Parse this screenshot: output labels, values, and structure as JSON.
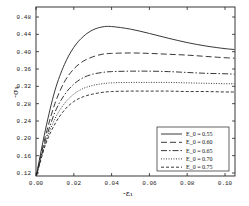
{
  "chart_data": {
    "type": "line",
    "title": "",
    "xlabel": "-ε₁",
    "ylabel": "-σ₁",
    "xlim": [
      0.0,
      0.105
    ],
    "ylim": [
      0.11,
      0.49
    ],
    "x_ticks": [
      "0.00",
      "0.02",
      "0.04",
      "0.06",
      "0.08",
      "0.10"
    ],
    "y_ticks": [
      "0.12",
      "0.16",
      "0.20",
      "0.24",
      "0.28",
      "0.32",
      "0.36",
      "0.40",
      "0.44",
      "0.48"
    ],
    "grid": false,
    "legend_position": "lower right",
    "x": [
      0.0,
      0.005,
      0.01,
      0.015,
      0.02,
      0.025,
      0.03,
      0.035,
      0.04,
      0.05,
      0.06,
      0.07,
      0.08,
      0.09,
      0.1,
      0.105
    ],
    "series": [
      {
        "name": "E_0 = 0.55",
        "style": "solid",
        "values": [
          0.11,
          0.22,
          0.31,
          0.37,
          0.41,
          0.435,
          0.45,
          0.457,
          0.458,
          0.452,
          0.442,
          0.431,
          0.421,
          0.413,
          0.407,
          0.405
        ]
      },
      {
        "name": "E_0 = 0.60",
        "style": "dashed-long",
        "values": [
          0.11,
          0.205,
          0.28,
          0.33,
          0.36,
          0.378,
          0.388,
          0.394,
          0.396,
          0.397,
          0.396,
          0.394,
          0.392,
          0.389,
          0.386,
          0.385
        ]
      },
      {
        "name": "E_0 = 0.65",
        "style": "dash-dot",
        "values": [
          0.11,
          0.195,
          0.26,
          0.3,
          0.325,
          0.34,
          0.348,
          0.352,
          0.354,
          0.355,
          0.355,
          0.354,
          0.352,
          0.35,
          0.349,
          0.348
        ]
      },
      {
        "name": "E_0 = 0.70",
        "style": "dotted",
        "values": [
          0.11,
          0.19,
          0.245,
          0.28,
          0.302,
          0.315,
          0.322,
          0.326,
          0.328,
          0.329,
          0.329,
          0.329,
          0.328,
          0.327,
          0.326,
          0.326
        ]
      },
      {
        "name": "E_0 = 0.75",
        "style": "dashed-short",
        "values": [
          0.11,
          0.185,
          0.233,
          0.265,
          0.285,
          0.296,
          0.302,
          0.306,
          0.308,
          0.309,
          0.309,
          0.309,
          0.308,
          0.308,
          0.307,
          0.307
        ]
      }
    ]
  },
  "legend": {
    "items": [
      "E_0 = 0.55",
      "E_0 = 0.60",
      "E_0 = 0.65",
      "E_0 = 0.70",
      "E_0 = 0.75"
    ]
  },
  "axes": {
    "xlabel": "-ε₁",
    "ylabel": "-σ₁"
  }
}
